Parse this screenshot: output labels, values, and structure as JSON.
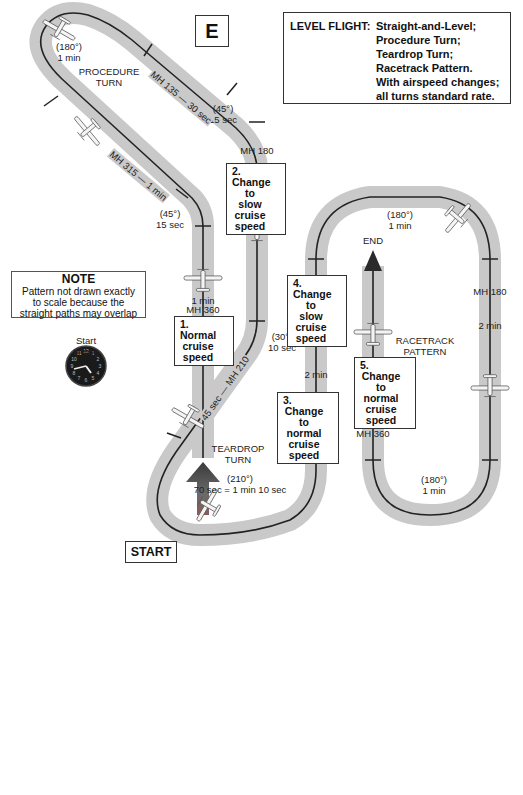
{
  "figure_label": "E",
  "title_box": {
    "key": "LEVEL FLIGHT:",
    "lines": [
      "Straight-and-Level;",
      "Procedure Turn;",
      "Teardrop Turn;",
      "Racetrack Pattern.",
      "With airspeed changes;",
      "all turns standard rate."
    ]
  },
  "note": {
    "title": "NOTE",
    "lines": [
      "Pattern not drawn exactly",
      "to scale because the",
      "straight paths may overlap"
    ]
  },
  "start": {
    "timing_label_1": "Start",
    "timing_label_2": "timing",
    "start_label": "START",
    "clock_icon": "analog-clock"
  },
  "end_label": "END",
  "pattern_labels": {
    "procedure_turn": [
      "PROCEDURE",
      "TURN"
    ],
    "teardrop_turn": [
      "TEARDROP",
      "TURN"
    ],
    "racetrack_pattern": [
      "RACETRACK",
      "PATTERN"
    ]
  },
  "turn_labels": {
    "procedure_180": [
      "(180°)",
      "1 min"
    ],
    "upper_45": [
      "(45°)",
      "15 sec"
    ],
    "lower_45": [
      "(45°)",
      "15 sec"
    ],
    "turn_30": [
      "(30°)",
      "10 sec"
    ],
    "teardrop_210": [
      "(210°)",
      "70 sec = 1 min 10 sec"
    ],
    "racetrack_top_180": [
      "(180°)",
      "1 min"
    ],
    "racetrack_bottom_180": [
      "(180°)",
      "1 min"
    ]
  },
  "leg_labels": {
    "mh135": "MH 135 — 30 sec",
    "mh315": "MH 315 — 1 min",
    "mh210": "45 sec — MH 210",
    "leg1_time": "1 min",
    "leg1_heading": "MH 360",
    "mh180_heading": "MH 180",
    "mh180_time": "2 min",
    "leg3_time": "2 min",
    "leg3_heading": "MH 360",
    "race_mh180": "MH 180",
    "race_right_time": "2 min",
    "leg5_time": "2 min",
    "leg5_heading": "MH 360"
  },
  "steps": [
    {
      "num": "1.",
      "lines": [
        "Normal",
        "cruise",
        "speed"
      ]
    },
    {
      "num": "2.",
      "lines": [
        "Change",
        "to slow",
        "cruise",
        "speed"
      ]
    },
    {
      "num": "3.",
      "lines": [
        "Change",
        "to normal",
        "cruise",
        "speed"
      ]
    },
    {
      "num": "4.",
      "lines": [
        "Change",
        "to slow",
        "cruise",
        "speed"
      ]
    },
    {
      "num": "5.",
      "lines": [
        "Change",
        "to normal",
        "cruise",
        "speed"
      ]
    }
  ],
  "colors": {
    "track_band": "#c9c9c9",
    "track_line": "#222222",
    "arrow_dark": "#3a3a3a",
    "arrow_light": "#8a8a8a"
  }
}
